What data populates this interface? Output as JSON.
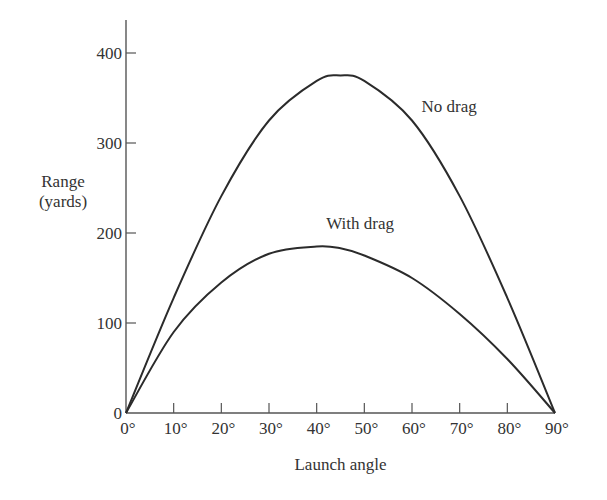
{
  "chart_data": {
    "type": "line",
    "title": "",
    "xlabel": "Launch angle",
    "ylabel_lines": [
      "Range",
      "(yards)"
    ],
    "ylabel": "Range (yards)",
    "xlim": [
      0,
      90
    ],
    "ylim": [
      0,
      440
    ],
    "grid": false,
    "legend": "inline labels",
    "x_ticks": [
      0,
      10,
      20,
      30,
      40,
      50,
      60,
      70,
      80,
      90
    ],
    "x_tick_labels": [
      "0°",
      "10°",
      "20°",
      "30°",
      "40°",
      "50°",
      "60°",
      "70°",
      "80°",
      "90°"
    ],
    "y_ticks": [
      0,
      100,
      200,
      300,
      400
    ],
    "y_tick_labels": [
      "0",
      "100",
      "200",
      "300",
      "400"
    ],
    "x": [
      0,
      10,
      20,
      30,
      40,
      45,
      50,
      60,
      70,
      80,
      90
    ],
    "series": [
      {
        "name": "No drag",
        "values": [
          0,
          128,
          241,
          325,
          369,
          375,
          369,
          325,
          241,
          128,
          0
        ],
        "label_pos": {
          "x": 62,
          "y": 335
        }
      },
      {
        "name": "With drag",
        "values": [
          0,
          90,
          145,
          177,
          185,
          183,
          175,
          150,
          110,
          60,
          0
        ],
        "label_pos": {
          "x": 42,
          "y": 205
        }
      }
    ],
    "annotations": [
      "No drag",
      "With drag"
    ]
  },
  "colors": {
    "line": "#2b2b2b",
    "axis": "#555555",
    "text": "#333333"
  }
}
